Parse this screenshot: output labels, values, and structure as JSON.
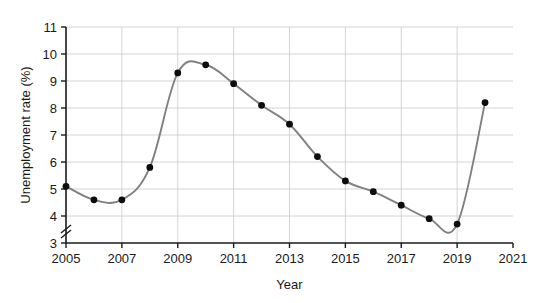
{
  "chart_data": {
    "type": "line",
    "title": "",
    "xlabel": "Year",
    "ylabel": "Unemployment rate (%)",
    "x": [
      2005,
      2006,
      2007,
      2008,
      2009,
      2010,
      2011,
      2012,
      2013,
      2014,
      2015,
      2016,
      2017,
      2018,
      2019,
      2020
    ],
    "values": [
      5.1,
      4.6,
      4.6,
      5.8,
      9.3,
      9.6,
      8.9,
      8.1,
      7.4,
      6.2,
      5.3,
      4.9,
      4.4,
      3.9,
      3.7,
      8.2
    ],
    "series": [
      {
        "name": "Unemployment rate",
        "values": [
          5.1,
          4.6,
          4.6,
          5.8,
          9.3,
          9.6,
          8.9,
          8.1,
          7.4,
          6.2,
          5.3,
          4.9,
          4.4,
          3.9,
          3.7,
          8.2
        ]
      }
    ],
    "xlim": [
      2005,
      2021
    ],
    "ylim": [
      3,
      11
    ],
    "xticks": [
      2005,
      2007,
      2009,
      2011,
      2013,
      2015,
      2017,
      2019,
      2021
    ],
    "xtick_labels": [
      "2005",
      "2007",
      "2009",
      "2011",
      "2013",
      "2015",
      "2017",
      "2019",
      "2021"
    ],
    "yticks": [
      3,
      4,
      5,
      6,
      7,
      8,
      9,
      10,
      11
    ],
    "ytick_labels": [
      "3",
      "4",
      "5",
      "6",
      "7",
      "8",
      "9",
      "10",
      "11"
    ],
    "grid": true,
    "grid_axis": "both",
    "legend": false,
    "axis_break": {
      "axis": "y",
      "label": "y-axis-break",
      "below_value": 3
    },
    "colors": {
      "line": "#808080",
      "marker": "#0d0d0d",
      "grid": "#c9c9c9",
      "axis": "#1a1a1a",
      "background": "#ffffff"
    },
    "marker_style": "filled-circle",
    "marker_radius": 3.4
  }
}
